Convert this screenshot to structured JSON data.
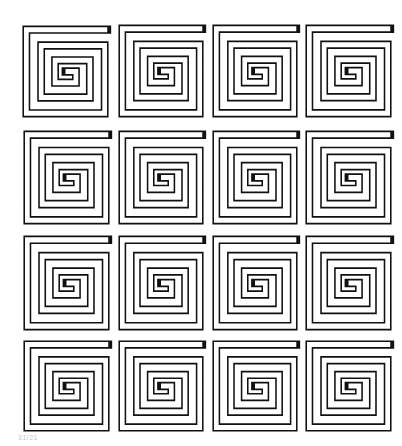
{
  "figure": {
    "type": "square-spiral-tile-pattern",
    "rows": 4,
    "cols": 4,
    "stroke_color": "#111111",
    "background_color": "#ffffff",
    "caption": "31/21"
  },
  "tiles": [
    {
      "row": 0,
      "col": 0,
      "x": 22,
      "y": 25,
      "w": 87,
      "h": 93
    },
    {
      "row": 0,
      "col": 1,
      "x": 118,
      "y": 24,
      "w": 86,
      "h": 94
    },
    {
      "row": 0,
      "col": 2,
      "x": 212,
      "y": 24,
      "w": 86,
      "h": 94
    },
    {
      "row": 0,
      "col": 3,
      "x": 305,
      "y": 24,
      "w": 87,
      "h": 94
    },
    {
      "row": 1,
      "col": 0,
      "x": 23,
      "y": 130,
      "w": 87,
      "h": 95
    },
    {
      "row": 1,
      "col": 1,
      "x": 118,
      "y": 130,
      "w": 86,
      "h": 95
    },
    {
      "row": 1,
      "col": 2,
      "x": 212,
      "y": 130,
      "w": 86,
      "h": 95
    },
    {
      "row": 1,
      "col": 3,
      "x": 305,
      "y": 130,
      "w": 87,
      "h": 95
    },
    {
      "row": 2,
      "col": 0,
      "x": 23,
      "y": 235,
      "w": 87,
      "h": 96
    },
    {
      "row": 2,
      "col": 1,
      "x": 118,
      "y": 235,
      "w": 86,
      "h": 96
    },
    {
      "row": 2,
      "col": 2,
      "x": 212,
      "y": 235,
      "w": 86,
      "h": 96
    },
    {
      "row": 2,
      "col": 3,
      "x": 305,
      "y": 235,
      "w": 87,
      "h": 96
    },
    {
      "row": 3,
      "col": 0,
      "x": 23,
      "y": 340,
      "w": 87,
      "h": 92
    },
    {
      "row": 3,
      "col": 1,
      "x": 118,
      "y": 340,
      "w": 86,
      "h": 92
    },
    {
      "row": 3,
      "col": 2,
      "x": 212,
      "y": 340,
      "w": 86,
      "h": 92
    },
    {
      "row": 3,
      "col": 3,
      "x": 305,
      "y": 340,
      "w": 87,
      "h": 92
    }
  ]
}
